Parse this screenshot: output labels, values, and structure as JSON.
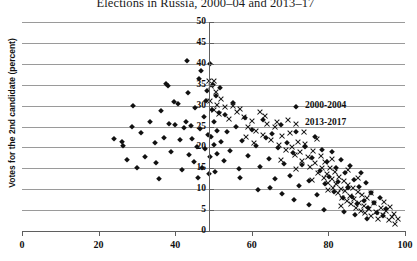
{
  "chart_data": {
    "type": "scatter",
    "title": "Elections in Russia, 2000–04 and 2013–17",
    "xlabel": "",
    "ylabel": "Votes for the 2nd candidate (percent)",
    "xlim": [
      0,
      100
    ],
    "ylim": [
      0,
      50
    ],
    "xticks": [
      "0",
      "20",
      "40",
      "60",
      "80",
      "100"
    ],
    "yticks": [
      "0",
      "5",
      "10",
      "15",
      "20",
      "25",
      "30",
      "35",
      "40",
      "45",
      "50"
    ],
    "grid": "horizontal",
    "legend_position": "inside-right",
    "series": [
      {
        "name": "2000-2004",
        "marker": "diamond",
        "color": "#111111",
        "points": [
          [
            26.0,
            21.2
          ],
          [
            26.4,
            20.3
          ],
          [
            27.5,
            17.0
          ],
          [
            28.6,
            24.8
          ],
          [
            29.0,
            30.0
          ],
          [
            31.0,
            23.4
          ],
          [
            32.0,
            17.6
          ],
          [
            33.4,
            26.0
          ],
          [
            34.8,
            21.0
          ],
          [
            35.0,
            16.2
          ],
          [
            36.2,
            28.8
          ],
          [
            37.0,
            22.3
          ],
          [
            37.6,
            35.2
          ],
          [
            38.0,
            34.8
          ],
          [
            38.4,
            25.6
          ],
          [
            39.0,
            19.0
          ],
          [
            40.0,
            25.3
          ],
          [
            40.6,
            30.4
          ],
          [
            41.2,
            21.8
          ],
          [
            41.8,
            14.6
          ],
          [
            42.2,
            24.6
          ],
          [
            42.8,
            26.0
          ],
          [
            43.0,
            40.6
          ],
          [
            43.6,
            18.2
          ],
          [
            44.0,
            25.2
          ],
          [
            44.4,
            22.0
          ],
          [
            44.8,
            16.4
          ],
          [
            45.2,
            29.5
          ],
          [
            45.6,
            20.0
          ],
          [
            46.0,
            12.8
          ],
          [
            46.4,
            24.4
          ],
          [
            46.8,
            38.2
          ],
          [
            47.0,
            15.0
          ],
          [
            47.4,
            27.4
          ],
          [
            47.8,
            19.6
          ],
          [
            48.0,
            31.0
          ],
          [
            48.2,
            33.6
          ],
          [
            48.6,
            23.0
          ],
          [
            48.8,
            13.6
          ],
          [
            49.0,
            40.0
          ],
          [
            49.2,
            17.8
          ],
          [
            49.4,
            22.6
          ],
          [
            49.6,
            29.0
          ],
          [
            49.8,
            35.0
          ],
          [
            50.0,
            26.2
          ],
          [
            50.2,
            20.6
          ],
          [
            50.4,
            14.2
          ],
          [
            50.6,
            32.2
          ],
          [
            50.8,
            24.0
          ],
          [
            51.0,
            18.4
          ],
          [
            51.4,
            28.2
          ],
          [
            52.0,
            21.4
          ],
          [
            52.6,
            16.8
          ],
          [
            53.4,
            23.8
          ],
          [
            54.2,
            19.2
          ],
          [
            55.0,
            30.6
          ],
          [
            55.8,
            25.0
          ],
          [
            56.6,
            14.8
          ],
          [
            57.4,
            21.6
          ],
          [
            58.2,
            27.0
          ],
          [
            59.0,
            18.0
          ],
          [
            60.0,
            24.2
          ],
          [
            61.0,
            20.4
          ],
          [
            62.0,
            15.4
          ],
          [
            62.8,
            26.6
          ],
          [
            63.6,
            22.2
          ],
          [
            64.4,
            17.2
          ],
          [
            65.2,
            23.2
          ],
          [
            66.0,
            12.4
          ],
          [
            66.8,
            19.8
          ],
          [
            67.6,
            25.4
          ],
          [
            68.4,
            16.0
          ],
          [
            69.2,
            21.0
          ],
          [
            70.0,
            13.2
          ],
          [
            70.8,
            18.6
          ],
          [
            71.6,
            23.6
          ],
          [
            72.4,
            10.8
          ],
          [
            73.2,
            15.8
          ],
          [
            74.0,
            20.2
          ],
          [
            74.8,
            12.0
          ],
          [
            75.6,
            17.4
          ],
          [
            76.4,
            22.4
          ],
          [
            77.0,
            8.6
          ],
          [
            77.8,
            14.4
          ],
          [
            78.4,
            19.4
          ],
          [
            79.0,
            11.2
          ],
          [
            79.6,
            16.6
          ],
          [
            80.2,
            13.0
          ],
          [
            80.8,
            18.8
          ],
          [
            81.4,
            9.4
          ],
          [
            82.0,
            15.2
          ],
          [
            82.6,
            11.8
          ],
          [
            83.2,
            17.0
          ],
          [
            83.8,
            7.8
          ],
          [
            84.4,
            13.8
          ],
          [
            85.0,
            10.2
          ],
          [
            85.6,
            15.6
          ],
          [
            86.2,
            8.2
          ],
          [
            86.8,
            12.2
          ],
          [
            87.4,
            6.4
          ],
          [
            88.0,
            10.6
          ],
          [
            88.6,
            14.0
          ],
          [
            89.2,
            7.2
          ],
          [
            89.8,
            11.4
          ],
          [
            90.4,
            5.6
          ],
          [
            91.0,
            9.0
          ],
          [
            91.8,
            6.8
          ],
          [
            92.6,
            4.4
          ],
          [
            93.4,
            8.0
          ],
          [
            94.2,
            3.6
          ],
          [
            95.0,
            5.2
          ],
          [
            30.0,
            15.2
          ],
          [
            24.0,
            22.0
          ],
          [
            35.8,
            12.4
          ],
          [
            39.8,
            30.8
          ],
          [
            43.2,
            33.0
          ],
          [
            46.2,
            36.4
          ],
          [
            51.8,
            34.2
          ],
          [
            53.0,
            27.8
          ],
          [
            57.0,
            12.6
          ],
          [
            61.6,
            9.8
          ],
          [
            64.8,
            10.4
          ],
          [
            68.0,
            8.8
          ],
          [
            71.0,
            7.4
          ],
          [
            75.0,
            6.2
          ],
          [
            78.8,
            5.0
          ],
          [
            84.0,
            4.6
          ],
          [
            87.0,
            3.8
          ],
          [
            90.0,
            3.0
          ]
        ]
      },
      {
        "name": "2013-2017",
        "marker": "cross",
        "color": "#111111",
        "points": [
          [
            48.8,
            36.0
          ],
          [
            49.4,
            34.6
          ],
          [
            50.2,
            35.8
          ],
          [
            50.6,
            33.2
          ],
          [
            51.0,
            30.2
          ],
          [
            51.4,
            28.0
          ],
          [
            52.0,
            31.6
          ],
          [
            55.0,
            30.0
          ],
          [
            56.0,
            28.6
          ],
          [
            57.0,
            29.2
          ],
          [
            58.0,
            27.2
          ],
          [
            59.0,
            25.0
          ],
          [
            60.0,
            26.4
          ],
          [
            61.0,
            24.0
          ],
          [
            62.0,
            28.4
          ],
          [
            63.0,
            23.0
          ],
          [
            64.0,
            25.6
          ],
          [
            65.0,
            21.8
          ],
          [
            66.0,
            24.8
          ],
          [
            67.0,
            20.6
          ],
          [
            68.0,
            22.8
          ],
          [
            69.0,
            19.4
          ],
          [
            70.0,
            23.4
          ],
          [
            70.6,
            20.0
          ],
          [
            71.2,
            18.2
          ],
          [
            72.0,
            21.2
          ],
          [
            72.6,
            19.0
          ],
          [
            73.2,
            16.8
          ],
          [
            74.0,
            20.8
          ],
          [
            74.6,
            17.6
          ],
          [
            75.2,
            15.4
          ],
          [
            76.0,
            19.2
          ],
          [
            76.6,
            16.2
          ],
          [
            77.2,
            14.0
          ],
          [
            78.0,
            18.0
          ],
          [
            78.4,
            15.0
          ],
          [
            78.8,
            12.8
          ],
          [
            79.2,
            16.4
          ],
          [
            79.6,
            13.6
          ],
          [
            80.0,
            11.6
          ],
          [
            80.4,
            15.2
          ],
          [
            80.8,
            12.4
          ],
          [
            81.2,
            10.4
          ],
          [
            81.6,
            14.2
          ],
          [
            82.0,
            11.2
          ],
          [
            82.4,
            9.2
          ],
          [
            82.8,
            13.0
          ],
          [
            83.2,
            10.0
          ],
          [
            83.6,
            8.0
          ],
          [
            84.0,
            12.0
          ],
          [
            84.4,
            9.6
          ],
          [
            84.8,
            7.2
          ],
          [
            85.2,
            11.0
          ],
          [
            85.6,
            8.4
          ],
          [
            86.0,
            6.4
          ],
          [
            86.4,
            10.2
          ],
          [
            86.8,
            7.6
          ],
          [
            87.2,
            5.6
          ],
          [
            87.6,
            9.4
          ],
          [
            88.0,
            6.8
          ],
          [
            88.4,
            4.8
          ],
          [
            88.8,
            8.6
          ],
          [
            89.2,
            6.0
          ],
          [
            89.6,
            4.2
          ],
          [
            90.0,
            7.8
          ],
          [
            90.6,
            5.2
          ],
          [
            91.2,
            3.6
          ],
          [
            91.8,
            6.6
          ],
          [
            92.4,
            4.6
          ],
          [
            93.0,
            3.0
          ],
          [
            93.6,
            5.4
          ],
          [
            94.2,
            3.8
          ],
          [
            95.0,
            4.8
          ],
          [
            95.8,
            2.6
          ],
          [
            96.6,
            3.4
          ],
          [
            97.4,
            1.8
          ],
          [
            98.2,
            2.8
          ],
          [
            53.0,
            29.6
          ],
          [
            54.0,
            26.8
          ],
          [
            49.0,
            31.0
          ],
          [
            50.0,
            29.0
          ],
          [
            63.5,
            27.6
          ],
          [
            66.5,
            26.0
          ],
          [
            69.5,
            26.6
          ],
          [
            73.6,
            23.8
          ],
          [
            77.0,
            22.0
          ],
          [
            81.0,
            17.2
          ],
          [
            85.0,
            14.6
          ],
          [
            60.5,
            21.0
          ],
          [
            58.5,
            22.4
          ],
          [
            67.5,
            17.0
          ],
          [
            71.5,
            14.8
          ],
          [
            75.8,
            12.2
          ],
          [
            79.8,
            9.8
          ],
          [
            83.4,
            6.0
          ],
          [
            87.8,
            12.6
          ],
          [
            91.0,
            9.0
          ],
          [
            94.6,
            7.0
          ],
          [
            96.0,
            5.8
          ],
          [
            97.0,
            4.0
          ]
        ]
      }
    ]
  },
  "legend": [
    {
      "label": "2000-2004",
      "marker": "diamond"
    },
    {
      "label": "2013-2017",
      "marker": "cross"
    }
  ],
  "axis": {
    "x_tick_labels": [
      "0",
      "20",
      "40",
      "60",
      "80",
      "100"
    ],
    "y_tick_labels": [
      "0",
      "5",
      "10",
      "15",
      "20",
      "25",
      "30",
      "35",
      "40",
      "45",
      "50"
    ]
  }
}
